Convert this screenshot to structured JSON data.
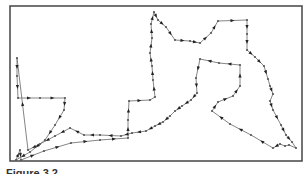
{
  "figure": {
    "frame": {
      "x": 10,
      "y": 6,
      "width": 292,
      "height": 155,
      "stroke": "#444444"
    },
    "path_color": "#777777",
    "node_color": "#555555",
    "arrow_color": "#222222",
    "tour": [
      [
        17,
        58
      ],
      [
        17,
        76
      ],
      [
        18,
        98
      ],
      [
        40,
        98
      ],
      [
        65,
        98
      ],
      [
        64,
        110
      ],
      [
        55,
        125
      ],
      [
        45,
        140
      ],
      [
        30,
        152
      ],
      [
        16,
        160
      ],
      [
        20,
        150
      ],
      [
        21,
        160
      ],
      [
        44,
        151
      ],
      [
        71,
        143
      ],
      [
        100,
        140
      ],
      [
        128,
        138
      ],
      [
        128,
        120
      ],
      [
        129,
        101
      ],
      [
        150,
        100
      ],
      [
        155,
        97
      ],
      [
        153,
        80
      ],
      [
        152,
        66
      ],
      [
        150,
        53
      ],
      [
        152,
        38
      ],
      [
        151,
        24
      ],
      [
        154,
        12
      ],
      [
        158,
        20
      ],
      [
        166,
        27
      ],
      [
        175,
        40
      ],
      [
        190,
        41
      ],
      [
        200,
        43
      ],
      [
        211,
        33
      ],
      [
        218,
        21
      ],
      [
        247,
        20
      ],
      [
        247,
        34
      ],
      [
        247,
        50
      ],
      [
        255,
        57
      ],
      [
        264,
        66
      ],
      [
        268,
        79
      ],
      [
        270,
        86
      ],
      [
        273,
        94
      ],
      [
        270,
        101
      ],
      [
        273,
        110
      ],
      [
        281,
        125
      ],
      [
        286,
        135
      ],
      [
        292,
        142
      ],
      [
        296,
        148
      ],
      [
        289,
        145
      ],
      [
        285,
        146
      ],
      [
        280,
        144
      ],
      [
        273,
        148
      ],
      [
        251,
        135
      ],
      [
        230,
        124
      ],
      [
        212,
        111
      ],
      [
        218,
        102
      ],
      [
        233,
        96
      ],
      [
        240,
        86
      ],
      [
        240,
        65
      ],
      [
        219,
        63
      ],
      [
        200,
        59
      ],
      [
        196,
        78
      ],
      [
        197,
        93
      ],
      [
        191,
        100
      ],
      [
        182,
        106
      ],
      [
        175,
        111
      ],
      [
        170,
        116
      ],
      [
        163,
        122
      ],
      [
        155,
        126
      ],
      [
        146,
        131
      ],
      [
        132,
        133
      ],
      [
        121,
        136
      ],
      [
        100,
        135
      ],
      [
        84,
        135
      ],
      [
        70,
        128
      ],
      [
        55,
        136
      ],
      [
        40,
        144
      ],
      [
        28,
        150
      ]
    ],
    "caption": "Figure 3.2"
  }
}
